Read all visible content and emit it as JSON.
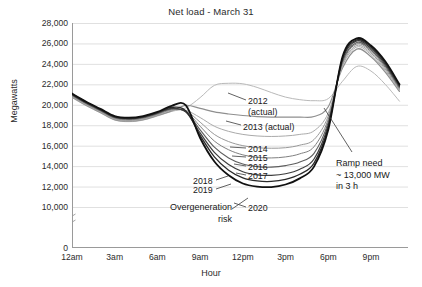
{
  "chart_data": {
    "type": "line",
    "title": "Net load - March 31",
    "xlabel": "Hour",
    "ylabel": "Megawatts",
    "ylim": [
      0,
      28000
    ],
    "ytick_step": 2000,
    "grid": true,
    "legend_position": "inline-labels",
    "axis_break_below": 10000,
    "ytick_labels": [
      "28,000",
      "26,000",
      "24,000",
      "22,000",
      "20,000",
      "18,000",
      "16,000",
      "14,000",
      "12,000",
      "10,000",
      "0"
    ],
    "ytick_values": [
      28000,
      26000,
      24000,
      22000,
      20000,
      18000,
      16000,
      14000,
      12000,
      10000,
      0
    ],
    "xtick_labels": [
      "12am",
      "3am",
      "6am",
      "9am",
      "12pm",
      "3pm",
      "6pm",
      "9pm"
    ],
    "xtick_hours": [
      0,
      3,
      6,
      9,
      12,
      15,
      18,
      21
    ],
    "x": [
      0,
      1,
      2,
      3,
      4,
      5,
      6,
      7,
      8,
      9,
      10,
      11,
      12,
      13,
      14,
      15,
      16,
      17,
      18,
      19,
      20,
      21,
      22,
      23
    ],
    "series": [
      {
        "name": "2012 (actual)",
        "label": "2012\n(actual)",
        "color": "#b9b9b9",
        "width": 1.0,
        "values": [
          20700,
          19900,
          19200,
          18500,
          18350,
          18500,
          18900,
          19350,
          19700,
          20700,
          21900,
          22100,
          22050,
          21700,
          21200,
          20750,
          20500,
          20400,
          20600,
          22300,
          23750,
          23300,
          22000,
          20350
        ]
      },
      {
        "name": "2013 (actual)",
        "label": "2013 (actual)",
        "color": "#8f8f8f",
        "width": 1.2,
        "values": [
          20750,
          19950,
          19250,
          18550,
          18400,
          18550,
          18950,
          19400,
          19950,
          19650,
          19300,
          19100,
          18950,
          18850,
          18800,
          18800,
          18800,
          18850,
          19800,
          23600,
          25450,
          24700,
          23200,
          21300
        ]
      },
      {
        "name": "2014",
        "label": "2014",
        "color": "#aaaaaa",
        "width": 1.0,
        "values": [
          20800,
          20000,
          19300,
          18600,
          18450,
          18600,
          19000,
          19450,
          19450,
          18750,
          17900,
          17400,
          17100,
          16950,
          16900,
          16950,
          17100,
          17450,
          19200,
          23800,
          25650,
          24900,
          23350,
          21400
        ]
      },
      {
        "name": "2015",
        "label": "2015",
        "color": "#999999",
        "width": 1.0,
        "values": [
          20850,
          20050,
          19350,
          18650,
          18500,
          18650,
          19050,
          19500,
          19400,
          18300,
          17100,
          16400,
          16000,
          15800,
          15750,
          15800,
          16050,
          16600,
          18900,
          23950,
          25800,
          25050,
          23500,
          21500
        ]
      },
      {
        "name": "2016",
        "label": "2016",
        "color": "#808080",
        "width": 1.0,
        "values": [
          20900,
          20100,
          19400,
          18700,
          18550,
          18700,
          19100,
          19550,
          19350,
          17900,
          16450,
          15600,
          15100,
          14850,
          14800,
          14900,
          15200,
          15900,
          18600,
          24100,
          25950,
          25200,
          23650,
          21600
        ]
      },
      {
        "name": "2017",
        "label": "2017",
        "color": "#5e5e5e",
        "width": 1.1,
        "values": [
          20950,
          20150,
          19450,
          18750,
          18600,
          18750,
          19150,
          19600,
          19300,
          17550,
          15850,
          14800,
          14200,
          13950,
          13900,
          14050,
          14400,
          15250,
          18300,
          24250,
          26100,
          25350,
          23800,
          21700
        ]
      },
      {
        "name": "2018",
        "label": "2018",
        "color": "#3d3d3d",
        "width": 1.2,
        "values": [
          21000,
          20200,
          19500,
          18800,
          18650,
          18800,
          19200,
          19650,
          19300,
          17250,
          15350,
          14150,
          13450,
          13150,
          13100,
          13250,
          13700,
          14700,
          18050,
          24400,
          26250,
          25500,
          23950,
          21800
        ]
      },
      {
        "name": "2019",
        "label": "2019",
        "color": "#2a2a2a",
        "width": 1.3,
        "values": [
          21050,
          20250,
          19550,
          18850,
          18700,
          18850,
          19250,
          19750,
          19400,
          17000,
          14900,
          13600,
          12850,
          12550,
          12500,
          12700,
          13200,
          14300,
          17800,
          24550,
          26350,
          25650,
          24100,
          21900
        ]
      },
      {
        "name": "2020",
        "label": "2020",
        "color": "#111111",
        "width": 1.8,
        "values": [
          21100,
          20300,
          19600,
          18900,
          18750,
          18900,
          19300,
          19900,
          19950,
          16750,
          14450,
          13100,
          12300,
          12000,
          11950,
          12200,
          12800,
          13950,
          17550,
          24700,
          26500,
          25800,
          24250,
          22000
        ]
      }
    ],
    "annotations": [
      {
        "name": "ramp-need",
        "lines": [
          "Ramp need",
          "~ 13,000 MW",
          "in 3 h"
        ],
        "text": "Ramp need ~ 13,000 MW in 3 h"
      },
      {
        "name": "overgeneration-risk",
        "lines": [
          "Overgeneration",
          "risk"
        ],
        "text": "Overgeneration risk"
      }
    ]
  }
}
